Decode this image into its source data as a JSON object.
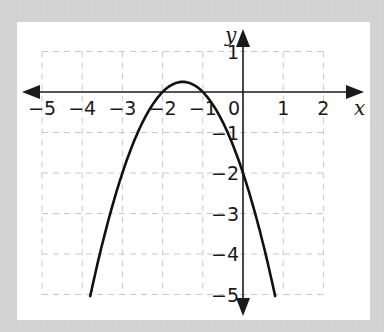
{
  "chart_data": {
    "type": "line",
    "title": "",
    "xlabel": "x",
    "ylabel": "y",
    "xlim": [
      -5,
      2
    ],
    "ylim": [
      -5,
      1
    ],
    "grid": true,
    "grid_style": "dashed",
    "x_ticks": [
      "−5",
      "−4",
      "−3",
      "−2",
      "−1",
      "0",
      "1",
      "2"
    ],
    "y_ticks": [
      "1",
      "−1",
      "−2",
      "−3",
      "−4",
      "−5"
    ],
    "series": [
      {
        "name": "y = -(x+1)(x+2)",
        "equation": "y = -x^2 - 3x - 2",
        "x": [
          -3.8,
          -3.5,
          -3,
          -2.5,
          -2,
          -1.5,
          -1,
          -0.5,
          0,
          0.5,
          0.8
        ],
        "y": [
          -5.04,
          -3.75,
          -2,
          -0.75,
          0,
          0.25,
          0,
          -0.75,
          -2,
          -3.75,
          -5.04
        ],
        "color": "#111111"
      }
    ],
    "annotations": {
      "roots": [
        -2,
        -1
      ],
      "vertex": [
        -1.5,
        0.25
      ],
      "y_intercept": -2
    }
  },
  "colors": {
    "background": "#d3d3d3",
    "panel": "#ffffff",
    "axis": "#1a1a1a",
    "grid": "#c8c8c8",
    "curve": "#111111"
  }
}
